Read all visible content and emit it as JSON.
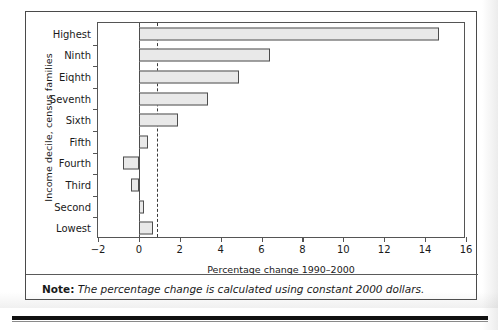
{
  "chart_data": {
    "type": "bar",
    "orientation": "horizontal",
    "title": "",
    "xlabel": "Percentage change 1990–2000",
    "ylabel": "Income decile, census families",
    "categories": [
      "Lowest",
      "Second",
      "Third",
      "Fourth",
      "Fifth",
      "Sixth",
      "Seventh",
      "Eiqhth",
      "Ninth",
      "Highest"
    ],
    "values": [
      0.7,
      0.25,
      -0.4,
      -0.8,
      0.45,
      1.9,
      3.4,
      4.9,
      6.4,
      14.7
    ],
    "xlim": [
      -2,
      16
    ],
    "xticks": [
      -2,
      0,
      2,
      4,
      6,
      8,
      10,
      12,
      14,
      16
    ],
    "xticklabels": [
      "−2",
      "0",
      "2",
      "4",
      "6",
      "8",
      "10",
      "12",
      "14",
      "16"
    ],
    "grid": false,
    "legend": null,
    "reference_line": {
      "value": 0.9,
      "style": "dashed"
    },
    "bar_fill": "#e9e9e9",
    "bar_edge": "#4d4d4d"
  },
  "note": {
    "label": "Note:",
    "text": "The percentage change is calculated using constant 2000 dollars."
  }
}
